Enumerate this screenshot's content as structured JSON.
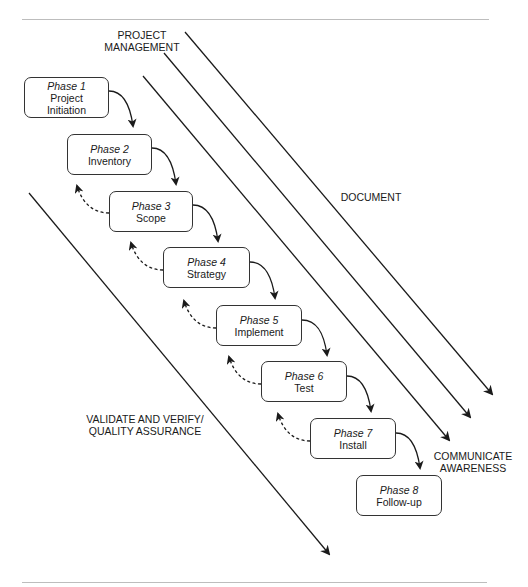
{
  "diagram": {
    "phases": [
      {
        "phase": "Phase 1",
        "name_lines": [
          "Project",
          "Initiation"
        ]
      },
      {
        "phase": "Phase 2",
        "name_lines": [
          "Inventory"
        ]
      },
      {
        "phase": "Phase 3",
        "name_lines": [
          "Scope"
        ]
      },
      {
        "phase": "Phase 4",
        "name_lines": [
          "Strategy"
        ]
      },
      {
        "phase": "Phase 5",
        "name_lines": [
          "Implement"
        ]
      },
      {
        "phase": "Phase 6",
        "name_lines": [
          "Test"
        ]
      },
      {
        "phase": "Phase 7",
        "name_lines": [
          "Install"
        ]
      },
      {
        "phase": "Phase 8",
        "name_lines": [
          "Follow-up"
        ]
      }
    ],
    "streams": {
      "project_management": [
        "PROJECT",
        "MANAGEMENT"
      ],
      "document": [
        "DOCUMENT"
      ],
      "communicate": [
        "COMMUNICATE",
        "AWARENESS"
      ],
      "validate": [
        "VALIDATE AND VERIFY/",
        "QUALITY ASSURANCE"
      ]
    },
    "colors": {
      "line": "#1a1a1a",
      "rule": "#bdbdbd",
      "box_border": "#333333"
    }
  }
}
